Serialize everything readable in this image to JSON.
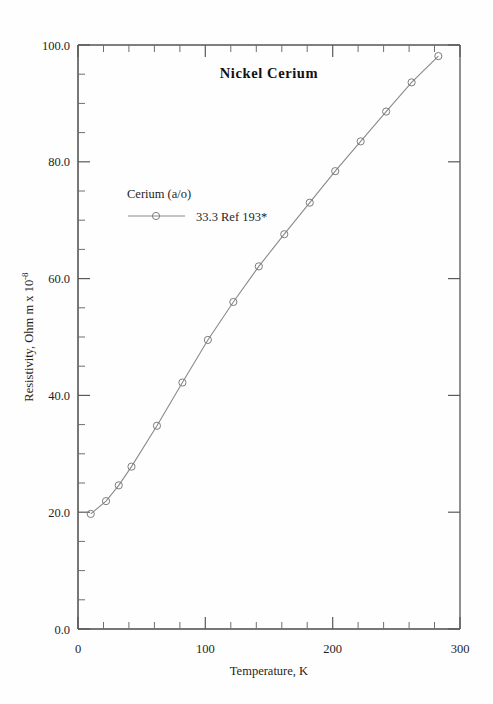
{
  "chart_data": {
    "type": "line",
    "title": "Nickel  Cerium",
    "xlabel": "Temperature,  K",
    "ylabel": "Resistivity, Ohm m x 10",
    "ylabel_exponent": "-8",
    "xlim": [
      0,
      300
    ],
    "ylim": [
      0.0,
      100.0
    ],
    "x_ticks": [
      0,
      100,
      200,
      300
    ],
    "x_tick_labels": [
      "0",
      "100",
      "200",
      "300"
    ],
    "x_minor_step": 20,
    "y_ticks": [
      0.0,
      20.0,
      40.0,
      60.0,
      80.0,
      100.0
    ],
    "y_tick_labels": [
      "0.0",
      "20.0",
      "40.0",
      "60.0",
      "80.0",
      "100.0"
    ],
    "y_minor_step": 5,
    "grid": false,
    "legend_position": "upper-left-inside",
    "legend_title": "Cerium (a/o)",
    "marker": "open-circle",
    "series": [
      {
        "name": "33.3 Ref 193*",
        "color": "#8a8a8a",
        "x": [
          10,
          22,
          32,
          42,
          62,
          82,
          102,
          122,
          142,
          162,
          182,
          202,
          222,
          242,
          262,
          283
        ],
        "values": [
          19.7,
          21.9,
          24.6,
          27.8,
          34.8,
          42.2,
          49.5,
          56.0,
          62.1,
          67.6,
          73.0,
          78.4,
          83.5,
          88.6,
          93.6,
          98.1
        ]
      }
    ]
  },
  "legend": {
    "header": "Cerium (a/o)",
    "entry_label": "33.3 Ref 193*"
  },
  "title": {
    "text": "Nickel  Cerium"
  },
  "axes": {
    "x_title": "Temperature,  K",
    "y_title_main": "Resistivity, Ohm m x 10",
    "y_title_sup": "-8"
  }
}
